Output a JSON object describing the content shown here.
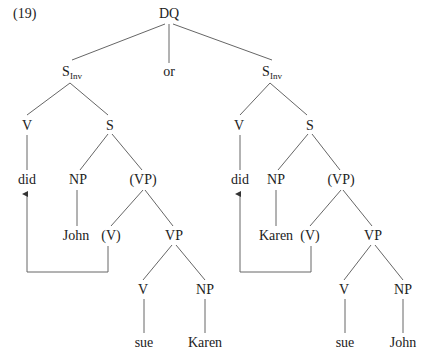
{
  "example_number": "(19)",
  "nodes": {
    "root": {
      "label": "DQ",
      "x": 169,
      "y": 14
    },
    "or": {
      "label": "or",
      "x": 169,
      "y": 72
    },
    "left": {
      "sinv": {
        "label": "S",
        "sub": "Inv",
        "x": 70,
        "y": 72
      },
      "v": {
        "label": "V",
        "x": 27,
        "y": 126
      },
      "s": {
        "label": "S",
        "x": 110,
        "y": 126
      },
      "did": {
        "label": "did",
        "x": 27,
        "y": 180
      },
      "np": {
        "label": "NP",
        "x": 78,
        "y": 180
      },
      "vp_paren": {
        "label": "(VP)",
        "x": 143,
        "y": 180
      },
      "np_word": {
        "label": "John",
        "x": 76,
        "y": 236
      },
      "v_paren": {
        "label": "(V)",
        "x": 111,
        "y": 236
      },
      "vp": {
        "label": "VP",
        "x": 174,
        "y": 236
      },
      "v2": {
        "label": "V",
        "x": 143,
        "y": 290
      },
      "np2": {
        "label": "NP",
        "x": 205,
        "y": 290
      },
      "verb": {
        "label": "sue",
        "x": 144,
        "y": 343
      },
      "obj": {
        "label": "Karen",
        "x": 205,
        "y": 343
      }
    },
    "right": {
      "sinv": {
        "label": "S",
        "sub": "Inv",
        "x": 270,
        "y": 72
      },
      "v": {
        "label": "V",
        "x": 239,
        "y": 126
      },
      "s": {
        "label": "S",
        "x": 310,
        "y": 126
      },
      "did": {
        "label": "did",
        "x": 240,
        "y": 180
      },
      "np": {
        "label": "NP",
        "x": 276,
        "y": 180
      },
      "vp_paren": {
        "label": "(VP)",
        "x": 341,
        "y": 180
      },
      "np_word": {
        "label": "Karen",
        "x": 276,
        "y": 236
      },
      "v_paren": {
        "label": "(V)",
        "x": 310,
        "y": 236
      },
      "vp": {
        "label": "VP",
        "x": 373,
        "y": 236
      },
      "v2": {
        "label": "V",
        "x": 344,
        "y": 290
      },
      "np2": {
        "label": "NP",
        "x": 403,
        "y": 290
      },
      "verb": {
        "label": "sue",
        "x": 345,
        "y": 343
      },
      "obj": {
        "label": "John",
        "x": 403,
        "y": 343
      }
    }
  },
  "colors": {
    "line": "#555555",
    "text": "#222222"
  }
}
